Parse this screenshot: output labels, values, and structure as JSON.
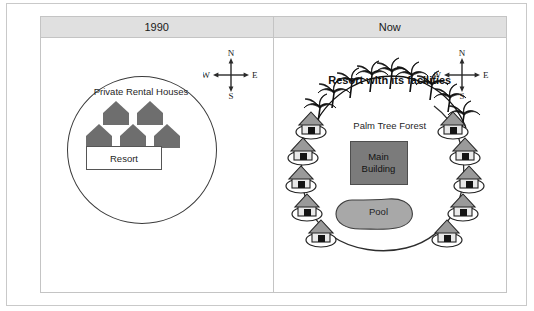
{
  "diagram": {
    "type": "before-after-site-map",
    "panels": [
      {
        "id": "1990",
        "header": "1990",
        "compass": {
          "north": "N",
          "east": "E",
          "south": "S",
          "west": "W"
        },
        "region_label": "Private Rental Houses",
        "house_count": 5,
        "building_label": "Resort"
      },
      {
        "id": "now",
        "header": "Now",
        "compass": {
          "north": "N",
          "east": "E",
          "south": "S",
          "west": "W"
        },
        "title": "Resort with its facilities",
        "forest_label": "Palm Tree Forest",
        "main_building_line1": "Main",
        "main_building_line2": "Building",
        "pool_label": "Pool",
        "bungalow_count_left": 5,
        "bungalow_count_right": 5
      }
    ]
  },
  "colors": {
    "frame_border": "#c9c9c9",
    "header_bg": "#e0e0e0",
    "house_fill": "#6e6e6e",
    "main_building_fill": "#7b7b7b",
    "pool_fill": "#a8a8a8",
    "palm_tree": "#111111",
    "text": "#1f1f1f"
  }
}
